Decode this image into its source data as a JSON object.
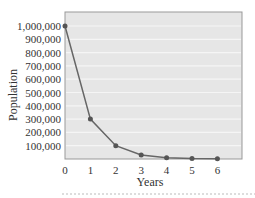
{
  "chart_data": {
    "type": "line",
    "title": "",
    "xlabel": "Years",
    "ylabel": "Population",
    "x": [
      0,
      1,
      2,
      3,
      4,
      5,
      6
    ],
    "series": [
      {
        "name": "Population",
        "values": [
          1000000,
          300000,
          100000,
          30000,
          10000,
          3000,
          1000
        ]
      }
    ],
    "xticks": [
      "0",
      "1",
      "2",
      "3",
      "4",
      "5",
      "6"
    ],
    "yticks": [
      "100,000",
      "200,000",
      "300,000",
      "400,000",
      "500,000",
      "600,000",
      "700,000",
      "800,000",
      "900,000",
      "1,000,000"
    ],
    "xlim": [
      0,
      7
    ],
    "ylim": [
      0,
      1100000
    ],
    "grid": true,
    "legend": "none",
    "colors": {
      "line": "#666666",
      "marker": "#555555",
      "plot_bg": "#e6e6e6",
      "grid": "#f5f5f5",
      "frame": "#999999"
    }
  }
}
